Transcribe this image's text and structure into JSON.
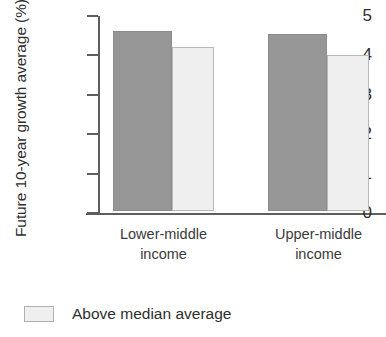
{
  "chart_data": {
    "type": "bar",
    "title": "",
    "xlabel": "",
    "ylabel": "Future 10-year growth average (%)",
    "ylim": [
      0,
      5
    ],
    "yticks": [
      "0",
      "1",
      "2",
      "3",
      "4",
      "5"
    ],
    "grid": false,
    "legend_position": "bottom-left",
    "categories": [
      "Lower-middle income",
      "Upper-middle income"
    ],
    "category_lines": [
      [
        "Lower-middle",
        "income"
      ],
      [
        "Upper-middle",
        "income"
      ]
    ],
    "series": [
      {
        "name": "",
        "color": "#969696",
        "values": [
          4.58,
          4.5
        ]
      },
      {
        "name": "Above median average",
        "color": "#efefef",
        "values": [
          4.17,
          3.95
        ]
      }
    ],
    "legend": [
      {
        "label": "Above median average",
        "color": "#efefef"
      }
    ]
  }
}
